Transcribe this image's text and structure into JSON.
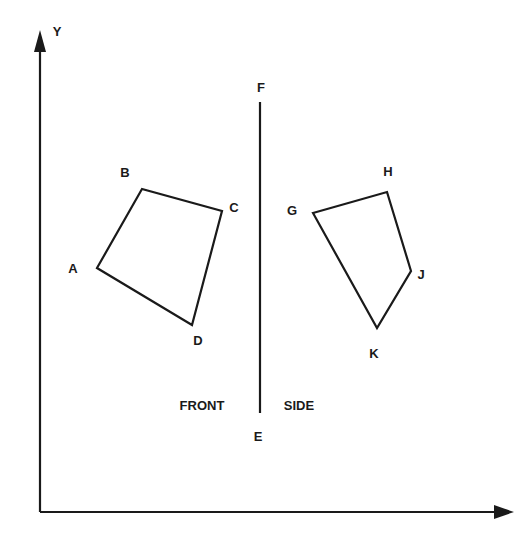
{
  "axes": {
    "y_label": "Y",
    "x_label": "",
    "color": "#1a1a1a"
  },
  "divider": {
    "top_label": "F",
    "bottom_label": "E"
  },
  "views": {
    "front": {
      "title": "FRONT",
      "vertices": [
        {
          "label": "A",
          "x": 97,
          "y": 268
        },
        {
          "label": "B",
          "x": 142,
          "y": 189
        },
        {
          "label": "C",
          "x": 222,
          "y": 211
        },
        {
          "label": "D",
          "x": 192,
          "y": 325
        }
      ]
    },
    "side": {
      "title": "SIDE",
      "vertices": [
        {
          "label": "G",
          "x": 313,
          "y": 213
        },
        {
          "label": "H",
          "x": 387,
          "y": 192
        },
        {
          "label": "J",
          "x": 411,
          "y": 271
        },
        {
          "label": "K",
          "x": 377,
          "y": 328
        }
      ]
    }
  }
}
